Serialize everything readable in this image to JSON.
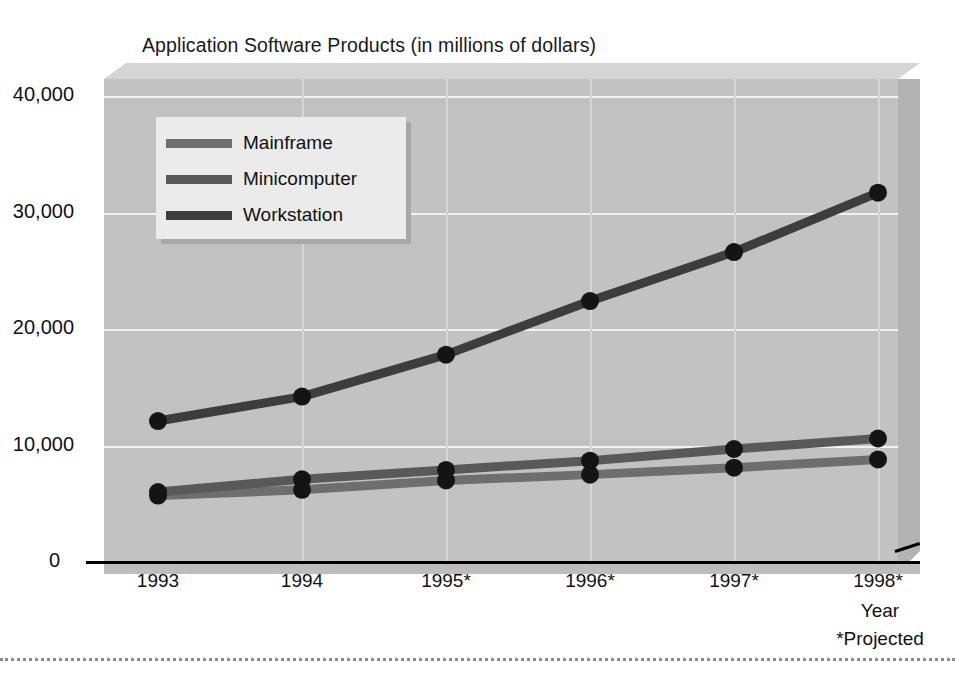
{
  "chart_data": {
    "type": "line",
    "title": "Application Software Products (in millions of dollars)",
    "xlabel": "Year",
    "ylabel": "",
    "footnote": "*Projected",
    "categories": [
      "1993",
      "1994",
      "1995*",
      "1996*",
      "1997*",
      "1998*"
    ],
    "ylim": [
      0,
      40000
    ],
    "yticks": [
      "0",
      "10,000",
      "20,000",
      "30,000",
      "40,000"
    ],
    "ytick_values": [
      0,
      10000,
      20000,
      30000,
      40000
    ],
    "grid": true,
    "legend_position": "upper-left-inside",
    "series": [
      {
        "name": "Mainframe",
        "color": "#6e6e6e",
        "values": [
          5700,
          6200,
          7000,
          7500,
          8100,
          8800
        ]
      },
      {
        "name": "Minicomputer",
        "color": "#595959",
        "values": [
          6000,
          7100,
          7900,
          8700,
          9700,
          10600
        ]
      },
      {
        "name": "Workstation",
        "color": "#3d3d3d",
        "values": [
          12100,
          14200,
          17800,
          22400,
          26600,
          31700
        ]
      }
    ]
  },
  "colors": {
    "plot_wall": "#c2c2c2",
    "bevel_top": "#d5d5d5",
    "bevel_right": "#b3b3b3",
    "gridline": "#f2f2f2",
    "legend_bg": "#ebebeb",
    "legend_shadow": "#a8a8a8",
    "axis": "#000000",
    "marker": "#141414",
    "text": "#111111"
  }
}
